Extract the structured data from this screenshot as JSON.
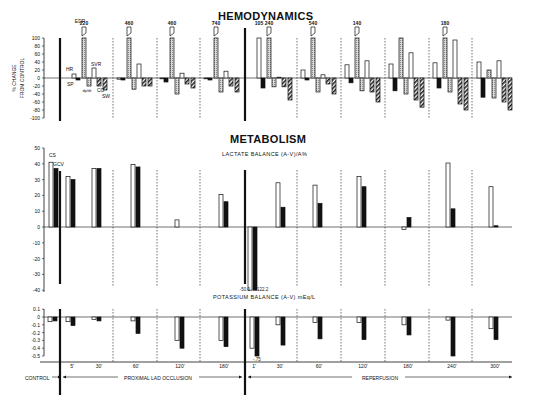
{
  "chart_data": [
    {
      "type": "bar",
      "title": "HEMODYNAMICS",
      "ylabel": "% CHANGE FROM CONTROL",
      "ylim": [
        -100,
        100
      ],
      "yticks": [
        100,
        80,
        60,
        40,
        20,
        0,
        -20,
        -40,
        -60,
        -80,
        -100
      ],
      "series_names": [
        "HR",
        "SP",
        "EDP",
        "dp/dt",
        "SVR",
        "CO",
        "SW"
      ],
      "series_labels_visible": {
        "HR": "HR",
        "SP": "SP",
        "EDP": "EDP",
        "dpdt": "dp/dt",
        "SVR": "SVR",
        "CO": "CO",
        "SW": "SW"
      },
      "categories": [
        "5'",
        "30'",
        "60'",
        "120'",
        "180'",
        "1'",
        "30'",
        "60'",
        "120'",
        "180'",
        "240'",
        "300'"
      ],
      "groups": [
        {
          "time": "5'",
          "HR": 10,
          "SP": -5,
          "EDP": 220,
          "EDP_label": "220",
          "dpdt": -20,
          "SVR": 25,
          "CO": -20,
          "SW": -30
        },
        {
          "time": "30'",
          "HR": -3,
          "SP": -5,
          "EDP": 460,
          "EDP_label": "460",
          "dpdt": -28,
          "SVR": 35,
          "CO": -20,
          "SW": -20
        },
        {
          "time": "60'",
          "HR": -2,
          "SP": -10,
          "EDP": 460,
          "EDP_label": "460",
          "dpdt": -40,
          "SVR": 12,
          "CO": -15,
          "SW": -25
        },
        {
          "time": "120'",
          "HR": -2,
          "SP": -5,
          "EDP": 740,
          "EDP_label": "740",
          "dpdt": -35,
          "SVR": 17,
          "CO": -20,
          "SW": -35
        },
        {
          "time": "1'",
          "HR": 105,
          "HR_label": "105",
          "SP": -25,
          "EDP": 240,
          "EDP_label": "240",
          "dpdt": -22,
          "SVR": 2,
          "CO": -22,
          "SW": -55
        },
        {
          "time": "30'",
          "HR": 20,
          "SP": -5,
          "EDP": 540,
          "EDP_label": "540",
          "dpdt": -35,
          "SVR": 8,
          "CO": -15,
          "SW": -40
        },
        {
          "time": "60'",
          "HR": 33,
          "SP": -12,
          "EDP": 140,
          "EDP_label": "140",
          "dpdt": -32,
          "SVR": 43,
          "CO": -35,
          "SW": -60
        },
        {
          "time": "120'",
          "HR": 35,
          "SP": -32,
          "EDP": 100,
          "dpdt": -40,
          "SVR": 63,
          "CO": -55,
          "SW": -73
        },
        {
          "time": "180'",
          "HR": 38,
          "SP": -25,
          "EDP": 180,
          "EDP_label": "180",
          "dpdt": -35,
          "SVR": 95,
          "CO": -65,
          "SW": -80
        },
        {
          "time": "240'",
          "HR": 40,
          "SP": -48,
          "EDP": 20,
          "dpdt": -50,
          "SVR": 43,
          "CO": -60,
          "SW": -80
        }
      ]
    },
    {
      "type": "bar",
      "title": "METABOLISM",
      "subtitle": "LACTATE BALANCE (A-V)/A%",
      "ylim": [
        -40,
        50
      ],
      "yticks": [
        50,
        40,
        30,
        20,
        10,
        0,
        -10,
        -20,
        -30,
        -40
      ],
      "legend": [
        "CS",
        "GCV"
      ],
      "categories": [
        "CONTROL",
        "5'",
        "30'",
        "60'",
        "120'",
        "180'",
        "1'",
        "30'",
        "60'",
        "120'",
        "180'",
        "240'",
        "300'"
      ],
      "series": [
        {
          "name": "CS",
          "style": "open",
          "values": [
            41,
            32,
            37,
            39.5,
            null,
            4.5,
            20.5,
            -50.0,
            28,
            26.5,
            32,
            -1.5,
            40.5,
            25.5
          ]
        },
        {
          "name": "GCV",
          "style": "solid",
          "values": [
            37,
            30,
            37,
            38,
            null,
            null,
            16,
            -122.2,
            12.5,
            15,
            25.5,
            6,
            11.5,
            0.8
          ]
        }
      ],
      "annotations": [
        "-50.0",
        "-122.2"
      ]
    },
    {
      "type": "bar",
      "title": "POTASSIUM BALANCE (A-V) mEq/L",
      "ylim": [
        -0.5,
        0.1
      ],
      "yticks": [
        "0.1",
        "0",
        "-0.1",
        "-0.2",
        "-0.3",
        "-0.4",
        "-0.5"
      ],
      "categories": [
        "CONTROL",
        "5'",
        "30'",
        "60'",
        "120'",
        "180'",
        "1'",
        "30'",
        "60'",
        "120'",
        "180'",
        "240'",
        "300'"
      ],
      "series": [
        {
          "name": "CS",
          "style": "open",
          "values": [
            -0.06,
            -0.06,
            -0.03,
            -0.05,
            -0.3,
            -0.3,
            -0.4,
            -0.1,
            -0.07,
            -0.07,
            -0.1,
            -0.04,
            -0.15
          ]
        },
        {
          "name": "GCV",
          "style": "solid",
          "values": [
            -0.05,
            -0.11,
            -0.05,
            -0.21,
            -0.4,
            -0.38,
            -0.75,
            -0.36,
            -0.28,
            -0.29,
            -0.23,
            -0.52,
            -0.29
          ]
        }
      ],
      "annotations": [
        "-.75"
      ]
    }
  ],
  "titles": {
    "hemo": "HEMODYNAMICS",
    "meta": "METABOLISM",
    "lactate": "LACTATE BALANCE (A-V)/A%",
    "potassium": "POTASSIUM BALANCE (A-V) mEq/L"
  },
  "axis": {
    "hemo_ylabel_1": "% CHANGE",
    "hemo_ylabel_2": "FROM CONTROL"
  },
  "time_labels": [
    "5'",
    "30'",
    "60'",
    "120'",
    "180'",
    "1'",
    "30'",
    "60'",
    "120'",
    "180'",
    "240'",
    "300'"
  ],
  "phases": {
    "control": "CONTROL",
    "occlusion": "PROXIMAL LAD OCCLUSION",
    "reperfusion": "REPERFUSION"
  },
  "colors": {
    "ink": "#111111",
    "stipple": "#bdbdbd",
    "background": "#ffffff"
  }
}
